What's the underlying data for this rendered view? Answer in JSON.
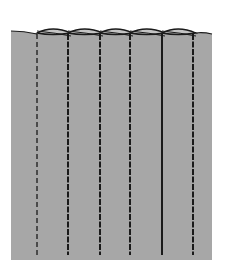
{
  "diagram": {
    "colors": {
      "background": "#ffffff",
      "fabric": "#a7a7a7",
      "fabric_fold_highlight": "#c4c4c4",
      "stitch": "#1a1a1a",
      "outline": "#1a1a1a"
    },
    "panel": {
      "left": 11,
      "right": 212,
      "top": 33,
      "bottom": 260
    },
    "stitch_lines": [
      {
        "x": 37,
        "style": "dashed"
      },
      {
        "x": 68,
        "style": "dashed-heavy"
      },
      {
        "x": 100,
        "style": "dashed-heavy"
      },
      {
        "x": 130,
        "style": "dashed-heavy"
      },
      {
        "x": 162,
        "style": "solid"
      },
      {
        "x": 193,
        "style": "dashed-heavy"
      }
    ],
    "folds": [
      {
        "left": 37,
        "right": 68
      },
      {
        "left": 68,
        "right": 100
      },
      {
        "left": 100,
        "right": 130
      },
      {
        "left": 130,
        "right": 162
      },
      {
        "left": 162,
        "right": 193
      }
    ]
  }
}
